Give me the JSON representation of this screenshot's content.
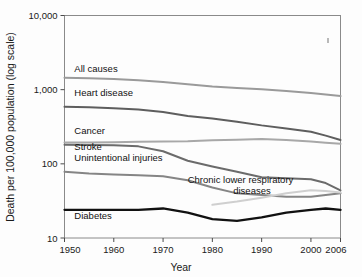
{
  "chart_data": {
    "type": "line",
    "title": "",
    "xlabel": "Year",
    "ylabel": "Death per 100,000 population (log scale)",
    "yscale": "log",
    "ylim": [
      10,
      10000
    ],
    "xlim": [
      1950,
      2006
    ],
    "grid": false,
    "legend_position": "inline-labels",
    "y_ticks": [
      "10,000",
      "1,000",
      "100",
      "10"
    ],
    "y_tick_values": [
      10000,
      1000,
      100,
      10
    ],
    "x_ticks": [
      "1950",
      "1960",
      "1970",
      "1980",
      "1990",
      "2000",
      "2006"
    ],
    "x_tick_values": [
      1950,
      1960,
      1970,
      1980,
      1990,
      2000,
      2006
    ],
    "series": [
      {
        "name": "All causes",
        "color": "#9a9a9a",
        "label_x": 1952,
        "label_y": 1750,
        "x": [
          1950,
          1955,
          1960,
          1965,
          1970,
          1975,
          1980,
          1985,
          1990,
          1995,
          2000,
          2003,
          2006
        ],
        "values": [
          1446,
          1420,
          1390,
          1340,
          1270,
          1180,
          1100,
          1050,
          1010,
          960,
          900,
          860,
          820
        ]
      },
      {
        "name": "Heart disease",
        "color": "#5e5e5e",
        "label_x": 1952,
        "label_y": 820,
        "x": [
          1950,
          1955,
          1960,
          1965,
          1970,
          1975,
          1980,
          1985,
          1990,
          1995,
          2000,
          2003,
          2006
        ],
        "values": [
          590,
          580,
          560,
          540,
          500,
          440,
          410,
          370,
          330,
          300,
          270,
          240,
          210
        ]
      },
      {
        "name": "Cancer",
        "color": "#a8a8a8",
        "label_x": 1952,
        "label_y": 250,
        "x": [
          1950,
          1955,
          1960,
          1965,
          1970,
          1975,
          1980,
          1985,
          1990,
          1995,
          2000,
          2003,
          2006
        ],
        "values": [
          194,
          194,
          196,
          198,
          200,
          202,
          208,
          212,
          216,
          210,
          200,
          193,
          186
        ]
      },
      {
        "name": "Stroke",
        "color": "#6b6b6b",
        "label_x": 1952,
        "label_y": 152,
        "x": [
          1950,
          1955,
          1960,
          1965,
          1970,
          1975,
          1980,
          1985,
          1990,
          1995,
          2000,
          2003,
          2006
        ],
        "values": [
          181,
          180,
          178,
          172,
          148,
          110,
          92,
          78,
          66,
          64,
          62,
          55,
          44
        ]
      },
      {
        "name": "Unintentional injuries",
        "color": "#858585",
        "label_x": 1952,
        "label_y": 108,
        "x": [
          1950,
          1955,
          1960,
          1965,
          1970,
          1975,
          1980,
          1985,
          1990,
          1995,
          2000,
          2003,
          2006
        ],
        "values": [
          78,
          74,
          72,
          70,
          68,
          60,
          48,
          40,
          38,
          36,
          36,
          38,
          40
        ]
      },
      {
        "name": "Chronic lower respiratory diseases",
        "color": "#cfcfcf",
        "label_x": 1975,
        "label_y": 56,
        "label_line2": "diseases",
        "x": [
          1980,
          1985,
          1990,
          1995,
          2000,
          2003,
          2006
        ],
        "values": [
          28,
          31,
          35,
          40,
          44,
          43,
          41
        ]
      },
      {
        "name": "Diabetes",
        "color": "#111111",
        "label_x": 1952,
        "label_y": 18,
        "x": [
          1950,
          1955,
          1960,
          1965,
          1970,
          1975,
          1980,
          1985,
          1990,
          1995,
          2000,
          2003,
          2006
        ],
        "values": [
          24,
          24,
          24,
          24,
          25,
          22,
          18,
          17,
          19,
          22,
          24,
          25,
          24
        ]
      }
    ]
  },
  "figure": {
    "y_axis_title": "Death per 100,000 population (log scale)",
    "x_axis_title": "Year"
  }
}
